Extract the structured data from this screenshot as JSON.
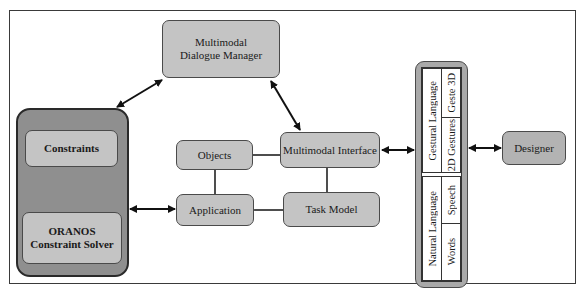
{
  "diagram": {
    "dialogue_manager": {
      "line1": "Multimodal",
      "line2": "Dialogue Manager"
    },
    "constraint_panel": {
      "constraints": "Constraints",
      "solver_line1": "ORANOS",
      "solver_line2": "Constraint Solver"
    },
    "objects": "Objects",
    "application": "Application",
    "multimodal_interface": "Multimodal Interface",
    "task_model": "Task Model",
    "modalities": {
      "gestural": {
        "label": "Gestural Language",
        "items": [
          "Geste 3D",
          "2D Gestures"
        ]
      },
      "natural": {
        "label": "Natural Language",
        "items": [
          "Speech",
          "Words"
        ]
      }
    },
    "designer": "Designer",
    "connections": [
      {
        "from": "Multimodal Dialogue Manager",
        "to": "Constraint Panel",
        "type": "bidirectional-arrow"
      },
      {
        "from": "Multimodal Dialogue Manager",
        "to": "Multimodal Interface",
        "type": "bidirectional-arrow"
      },
      {
        "from": "Constraints",
        "to": "ORANOS Constraint Solver",
        "type": "arrow"
      },
      {
        "from": "Constraint Panel",
        "to": "Application",
        "type": "bidirectional-arrow"
      },
      {
        "from": "Objects",
        "to": "Multimodal Interface",
        "type": "line"
      },
      {
        "from": "Objects",
        "to": "Application",
        "type": "line"
      },
      {
        "from": "Application",
        "to": "Task Model",
        "type": "line"
      },
      {
        "from": "Multimodal Interface",
        "to": "Task Model",
        "type": "line"
      },
      {
        "from": "Multimodal Interface",
        "to": "Modalities",
        "type": "bidirectional-arrow"
      },
      {
        "from": "Modalities",
        "to": "Designer",
        "type": "bidirectional-arrow"
      }
    ],
    "colors": {
      "box_fill": "#c4c4c4",
      "panel_fill": "#8f8f8f",
      "line": "#1a1a1a"
    }
  }
}
